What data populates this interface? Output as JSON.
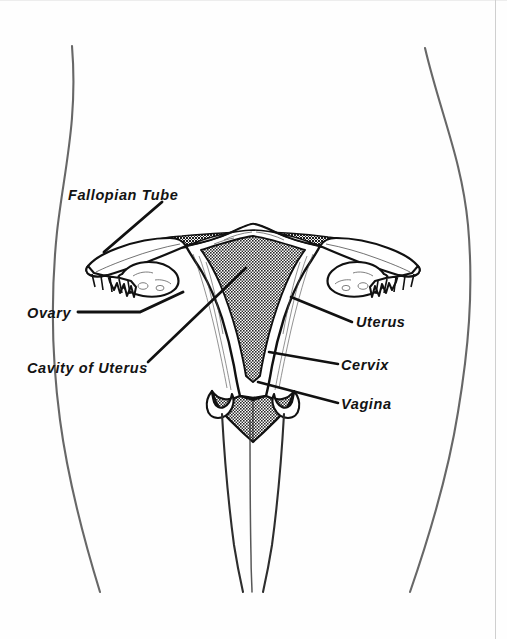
{
  "figure": {
    "background_color": "#fefefe",
    "ink_color": "#111111",
    "fill_gray": "#6e6e6e",
    "body_outline_color": "#4a4a4a",
    "border_color": "#cfcfcf"
  },
  "labels": {
    "fallopian_tube": "Fallopian Tube",
    "ovary": "Ovary",
    "cavity_of_uterus": "Cavity of Uterus",
    "uterus": "Uterus",
    "cervix": "Cervix",
    "vagina": "Vagina"
  },
  "leader_lines": [
    {
      "name": "fallopian-tube-leader",
      "from": [
        162,
        202
      ],
      "to": [
        104,
        252
      ]
    },
    {
      "name": "ovary-leader",
      "from": [
        78,
        312
      ],
      "to": [
        140,
        312
      ],
      "to2": [
        183,
        292
      ]
    },
    {
      "name": "cavity-of-uterus-leader",
      "from": [
        148,
        362
      ],
      "to": [
        246,
        268
      ]
    },
    {
      "name": "uterus-leader",
      "from": [
        352,
        322
      ],
      "to": [
        291,
        297
      ]
    },
    {
      "name": "cervix-leader",
      "from": [
        338,
        364
      ],
      "to": [
        269,
        352
      ]
    },
    {
      "name": "vagina-leader",
      "from": [
        338,
        403
      ],
      "to": [
        258,
        382
      ]
    }
  ],
  "structures": [
    {
      "name": "uterine-cavity",
      "fill": "stipple-gray",
      "description": "inverted triangular endometrial cavity"
    },
    {
      "name": "myometrium",
      "fill": "white",
      "description": "muscular uterine wall with fine striations"
    },
    {
      "name": "fundus",
      "fill": "white",
      "description": "dome at top of uterus"
    },
    {
      "name": "left-fallopian-tube",
      "fill": "white"
    },
    {
      "name": "right-fallopian-tube",
      "fill": "white"
    },
    {
      "name": "left-ovary",
      "fill": "white"
    },
    {
      "name": "right-ovary",
      "fill": "white"
    },
    {
      "name": "left-fimbriae",
      "fill": "white"
    },
    {
      "name": "right-fimbriae",
      "fill": "white"
    },
    {
      "name": "broad-ligament",
      "fill": "stipple-gray"
    },
    {
      "name": "cervix",
      "fill": "stipple-gray"
    },
    {
      "name": "vaginal-canal",
      "fill": "white"
    },
    {
      "name": "body-outline-left",
      "fill": "none"
    },
    {
      "name": "body-outline-right",
      "fill": "none"
    }
  ]
}
